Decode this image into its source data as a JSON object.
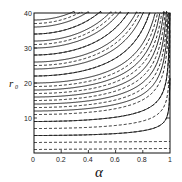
{
  "chart_data": {
    "type": "line",
    "title": "",
    "xlabel": "α",
    "ylabel": "r0",
    "xlim": [
      0,
      1
    ],
    "ylim": [
      0,
      40
    ],
    "x_ticks": [
      "0",
      "0.2",
      "0.4",
      "0.6",
      "0.8",
      "1"
    ],
    "y_ticks": [
      "10",
      "20",
      "30",
      "40"
    ],
    "grid": false,
    "legend": null,
    "series_description": "Family of solid curves r(α) starting at r0 = 2,4,...,38 at α=0, rising toward the top as α increases; dashed curves closely following solid curves at lower r0",
    "series": [
      {
        "name": "solid",
        "style": "solid",
        "r0_start": [
          5,
          9,
          12,
          14,
          16,
          18,
          20,
          22,
          24,
          26,
          28,
          30,
          32,
          34,
          36,
          38
        ]
      },
      {
        "name": "dashed",
        "style": "dashed",
        "r0_start": [
          1,
          3,
          5,
          7,
          9,
          11,
          13,
          15,
          17,
          19,
          22,
          25,
          28,
          31,
          34,
          37
        ]
      }
    ]
  },
  "labels": {
    "xlabel": "α",
    "ylabel_main": "r",
    "ylabel_sub": "0",
    "x0": "0",
    "x02": "0.2",
    "x04": "0.4",
    "x06": "0.6",
    "x08": "0.8",
    "x1": "1",
    "y10": "10",
    "y20": "20",
    "y30": "30",
    "y40": "40"
  }
}
